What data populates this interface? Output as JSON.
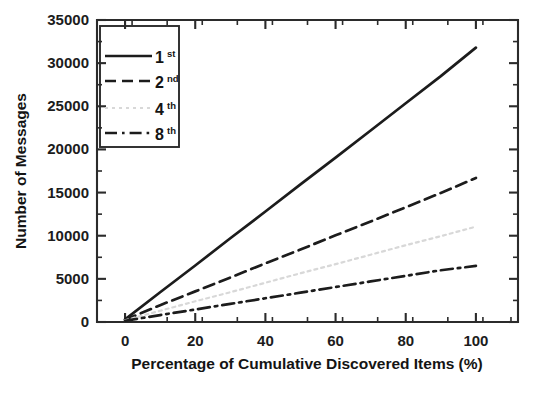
{
  "figure": {
    "caption_none": "",
    "background_color": "#ffffff",
    "ink_color": "#1c1c1c"
  },
  "axes": {
    "x": {
      "title": "Percentage of Cumulative Discovered Items (%)",
      "ticks": [
        "0",
        "20",
        "40",
        "60",
        "80",
        "100"
      ],
      "tick_values": [
        0,
        20,
        40,
        60,
        80,
        100
      ],
      "minor_step": 10,
      "range": [
        -8,
        112
      ]
    },
    "y": {
      "title": "Number of Messages",
      "ticks": [
        "0",
        "5000",
        "10000",
        "15000",
        "20000",
        "25000",
        "30000",
        "35000"
      ],
      "tick_values": [
        0,
        5000,
        10000,
        15000,
        20000,
        25000,
        30000,
        35000
      ],
      "minor_step": 2500,
      "range": [
        0,
        35000
      ]
    }
  },
  "legend": {
    "position": "top-left-inside",
    "entries": [
      {
        "base": "1",
        "sup": "st",
        "style": "solid",
        "color": "#1c1c1c"
      },
      {
        "base": "2",
        "sup": "nd",
        "style": "dashed",
        "color": "#1c1c1c"
      },
      {
        "base": "4",
        "sup": "th",
        "style": "faint-dotted",
        "color": "#d8d8d8"
      },
      {
        "base": "8",
        "sup": "th",
        "style": "dash-dot",
        "color": "#1c1c1c"
      }
    ]
  },
  "chart_data": {
    "type": "line",
    "title": "",
    "xlabel": "Percentage of Cumulative Discovered Items (%)",
    "ylabel": "Number of Messages",
    "xlim": [
      -8,
      112
    ],
    "ylim": [
      0,
      35000
    ],
    "grid": false,
    "legend_position": "upper left",
    "x": [
      0,
      10,
      20,
      30,
      40,
      50,
      60,
      70,
      80,
      90,
      100
    ],
    "series": [
      {
        "name": "1st",
        "line_style": "solid",
        "color": "#1c1c1c",
        "values": [
          300,
          3450,
          6550,
          9700,
          12800,
          15950,
          19050,
          22200,
          25350,
          28500,
          31800
        ]
      },
      {
        "name": "2nd",
        "line_style": "dashed",
        "color": "#1c1c1c",
        "values": [
          250,
          1950,
          3550,
          5150,
          6800,
          8400,
          10050,
          11650,
          13300,
          14950,
          16700
        ]
      },
      {
        "name": "4th",
        "line_style": "faint-dotted",
        "color": "#d8d8d8",
        "values": [
          200,
          1300,
          2400,
          3450,
          4550,
          5650,
          6700,
          7800,
          8900,
          9950,
          11050
        ]
      },
      {
        "name": "8th",
        "line_style": "dash-dot",
        "color": "#1c1c1c",
        "values": [
          150,
          800,
          1450,
          2100,
          2750,
          3400,
          4050,
          4700,
          5350,
          6000,
          6500
        ]
      }
    ]
  }
}
